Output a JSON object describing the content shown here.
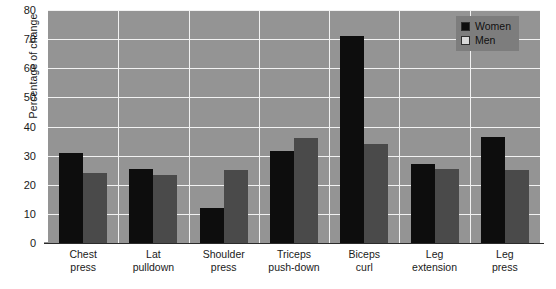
{
  "chart_data": {
    "type": "bar",
    "title": "",
    "xlabel": "",
    "ylabel": "Percentage of change",
    "ylim": [
      0,
      80
    ],
    "yticks": [
      0,
      10,
      20,
      30,
      40,
      50,
      60,
      70,
      80
    ],
    "grid": true,
    "legend_position": "top-right",
    "categories": [
      "Chest press",
      "Lat pulldown",
      "Shoulder press",
      "Triceps push-down",
      "Biceps curl",
      "Leg extension",
      "Leg press"
    ],
    "category_lines": [
      [
        "Chest",
        "press"
      ],
      [
        "Lat",
        "pulldown"
      ],
      [
        "Shoulder",
        "press"
      ],
      [
        "Triceps",
        "push-down"
      ],
      [
        "Biceps",
        "curl"
      ],
      [
        "Leg",
        "extension"
      ],
      [
        "Leg",
        "press"
      ]
    ],
    "series": [
      {
        "name": "Women",
        "color": "#0d0d0d",
        "values": [
          31,
          25.5,
          12,
          31.5,
          71,
          27,
          36.5
        ]
      },
      {
        "name": "Men",
        "color": "#4a4a4a",
        "values": [
          24,
          23.5,
          25,
          36,
          34,
          25.5,
          25
        ]
      }
    ]
  },
  "legend": {
    "items": [
      {
        "label": "Women",
        "swatch_color": "#0d0d0d"
      },
      {
        "label": "Men",
        "swatch_color": "#d8d8d8"
      }
    ]
  },
  "style": {
    "plot_background": "#949494",
    "gridline_color": "#f2f2f2",
    "legend_background": "#7d7d7d",
    "axis_color": "#2b2b2b",
    "text_color": "#1a1a1a"
  }
}
